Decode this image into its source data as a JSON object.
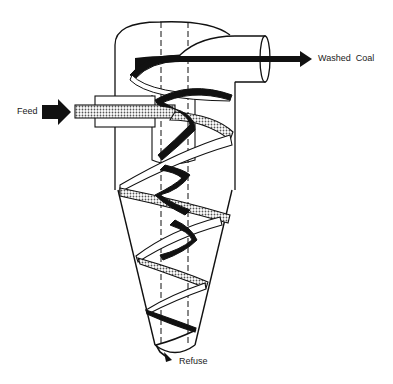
{
  "diagram": {
    "labels": {
      "washed_coal": "Washed  Coal",
      "feed": "Feed",
      "refuse": "Refuse"
    },
    "colors": {
      "line": "#111111",
      "background": "#ffffff",
      "stipple": "#888888"
    },
    "parts": [
      "cylindrical-body",
      "conical-section",
      "vortex-finder",
      "overflow-pipe",
      "feed-inlet",
      "outer-spiral-flow",
      "inner-spiral-flow",
      "underflow-apex"
    ]
  }
}
